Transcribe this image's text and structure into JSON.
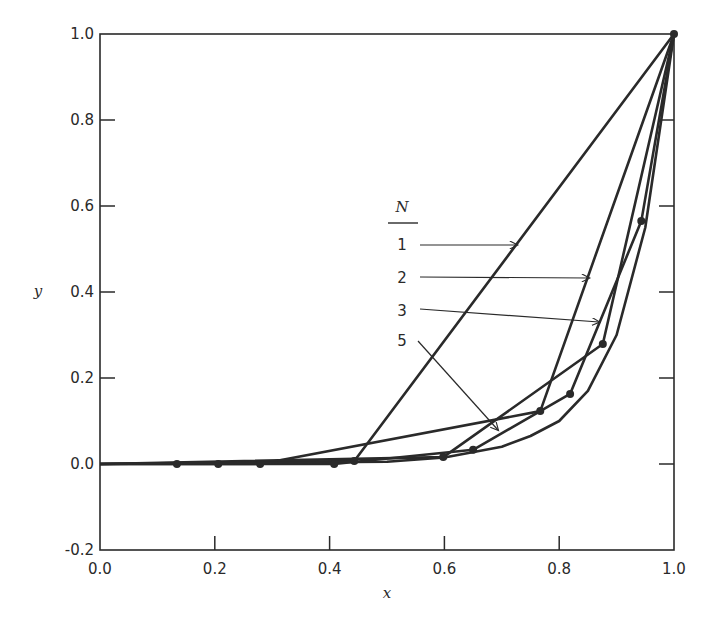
{
  "chart_data": {
    "type": "line",
    "title": "",
    "xlabel": "x",
    "ylabel": "y",
    "xlim": [
      0.0,
      1.0
    ],
    "ylim": [
      -0.2,
      1.0
    ],
    "grid": false,
    "x_ticks": [
      "0.0",
      "0.2",
      "0.4",
      "0.6",
      "0.8",
      "1.0"
    ],
    "y_ticks": [
      "-0.2",
      "0.0",
      "0.2",
      "0.4",
      "0.6",
      "0.8",
      "1.0"
    ],
    "legend": {
      "title": "N",
      "position": "center-right (annotated with arrows)",
      "entries": [
        "1",
        "2",
        "3",
        "5"
      ]
    },
    "series": [
      {
        "name": "1",
        "x": [
          0.0,
          0.443,
          1.0
        ],
        "y": [
          0.0,
          0.007,
          1.0
        ]
      },
      {
        "name": "2",
        "x": [
          0.0,
          0.279,
          0.767,
          1.0
        ],
        "y": [
          0.0,
          0.0,
          0.123,
          1.0
        ]
      },
      {
        "name": "3",
        "x": [
          0.0,
          0.598,
          0.876,
          1.0
        ],
        "y": [
          0.0,
          0.016,
          0.279,
          1.0
        ]
      },
      {
        "name": "5",
        "x": [
          0.0,
          0.134,
          0.206,
          0.408,
          0.65,
          0.819,
          0.943,
          1.0
        ],
        "y": [
          0.0,
          0.0,
          0.0,
          0.0,
          0.033,
          0.163,
          0.565,
          1.0
        ]
      },
      {
        "name": "exact",
        "x": [
          0.0,
          0.5,
          0.6,
          0.7,
          0.75,
          0.8,
          0.85,
          0.9,
          0.95,
          1.0
        ],
        "y": [
          0.0,
          0.005,
          0.015,
          0.04,
          0.065,
          0.1,
          0.17,
          0.3,
          0.55,
          1.0
        ]
      }
    ],
    "markers": {
      "x": [
        0.134,
        0.206,
        0.279,
        0.408,
        0.443,
        0.598,
        0.65,
        0.767,
        0.819,
        0.876,
        0.943,
        1.0
      ],
      "y": [
        0.0,
        0.0,
        0.0,
        0.0,
        0.007,
        0.016,
        0.033,
        0.123,
        0.163,
        0.279,
        0.565,
        1.0
      ]
    },
    "annotations": [
      {
        "label": "1",
        "text_pos": [
          0.56,
          0.51
        ],
        "arrow_to": [
          0.725,
          0.51
        ]
      },
      {
        "label": "2",
        "text_pos": [
          0.56,
          0.435
        ],
        "arrow_to": [
          0.85,
          0.435
        ]
      },
      {
        "label": "3",
        "text_pos": [
          0.56,
          0.36
        ],
        "arrow_to": [
          0.87,
          0.33
        ]
      },
      {
        "label": "5",
        "text_pos": [
          0.56,
          0.285
        ],
        "arrow_to": [
          0.69,
          0.08
        ]
      }
    ]
  }
}
